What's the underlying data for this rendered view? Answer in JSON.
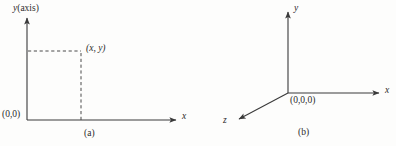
{
  "figure": {
    "background_color": "#fdfdfc",
    "ink_color": "#3a3a3a",
    "text_color": "#2b2b2b",
    "width": 396,
    "height": 146
  },
  "panel_a": {
    "caption": "(a)",
    "y_axis_label": "y(axis)",
    "y_axis_label_italic_part": "y",
    "y_axis_label_plain_part": "(axis)",
    "x_axis_label": "x",
    "origin_label": "(0,0)",
    "point_label": "(x, y)",
    "line_style_guides": "dashed",
    "line_style_axes": "solid"
  },
  "panel_b": {
    "caption": "(b)",
    "x_axis_label": "x",
    "y_axis_label": "y",
    "z_axis_label": "z",
    "origin_label": "(0,0,0)",
    "line_style_axes": "solid"
  }
}
